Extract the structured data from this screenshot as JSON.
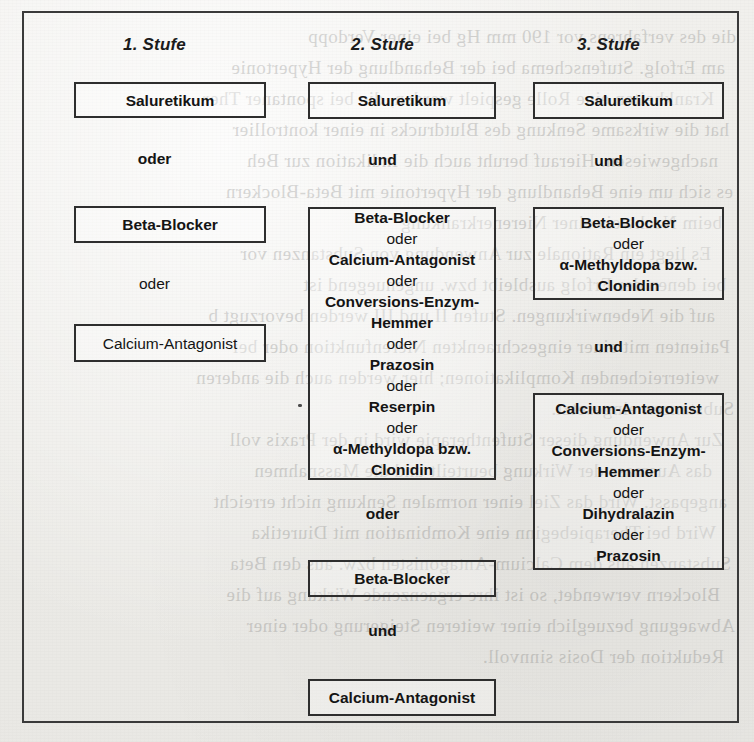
{
  "figure": {
    "columns": [
      {
        "header": "1. Stufe",
        "nodes": [
          {
            "kind": "box",
            "bold": true,
            "lines": [
              {
                "text": "Saluretikum",
                "type": "drug"
              }
            ]
          },
          {
            "kind": "connector",
            "text": "oder",
            "bold": true
          },
          {
            "kind": "box",
            "bold": true,
            "lines": [
              {
                "text": "Beta-Blocker",
                "type": "drug"
              }
            ]
          },
          {
            "kind": "connector",
            "text": "oder",
            "bold": false
          },
          {
            "kind": "box",
            "bold": false,
            "lines": [
              {
                "text": "Calcium-Antagonist",
                "type": "drug"
              }
            ]
          }
        ]
      },
      {
        "header": "2. Stufe",
        "nodes": [
          {
            "kind": "box",
            "bold": true,
            "lines": [
              {
                "text": "Saluretikum",
                "type": "drug"
              }
            ]
          },
          {
            "kind": "connector",
            "text": "und",
            "bold": true
          },
          {
            "kind": "box",
            "bold": true,
            "lines": [
              {
                "text": "Beta-Blocker",
                "type": "drug"
              },
              {
                "text": "oder",
                "type": "conj"
              },
              {
                "text": "Calcium-Antagonist",
                "type": "drug"
              },
              {
                "text": "oder",
                "type": "conj"
              },
              {
                "text": "Conversions-Enzym-",
                "type": "drug"
              },
              {
                "text": "Hemmer",
                "type": "drug"
              },
              {
                "text": "oder",
                "type": "conj"
              },
              {
                "text": "Prazosin",
                "type": "drug"
              },
              {
                "text": "oder",
                "type": "conj"
              },
              {
                "text": "Reserpin",
                "type": "drug"
              },
              {
                "text": "oder",
                "type": "conj"
              },
              {
                "text": "α-Methyldopa bzw.",
                "type": "drug"
              },
              {
                "text": "Clonidin",
                "type": "drug"
              }
            ]
          },
          {
            "kind": "connector",
            "text": "oder",
            "bold": true
          },
          {
            "kind": "box",
            "bold": true,
            "lines": [
              {
                "text": "Beta-Blocker",
                "type": "drug"
              }
            ]
          },
          {
            "kind": "connector",
            "text": "und",
            "bold": true
          },
          {
            "kind": "box",
            "bold": true,
            "lines": [
              {
                "text": "Calcium-Antagonist",
                "type": "drug"
              }
            ]
          }
        ]
      },
      {
        "header": "3. Stufe",
        "nodes": [
          {
            "kind": "box",
            "bold": true,
            "lines": [
              {
                "text": "Saluretikum",
                "type": "drug"
              }
            ]
          },
          {
            "kind": "connector",
            "text": "und",
            "bold": true
          },
          {
            "kind": "box",
            "bold": true,
            "lines": [
              {
                "text": "Beta-Blocker",
                "type": "drug"
              },
              {
                "text": "oder",
                "type": "conj"
              },
              {
                "text": "α-Methyldopa bzw.",
                "type": "drug"
              },
              {
                "text": "Clonidin",
                "type": "drug"
              }
            ]
          },
          {
            "kind": "connector",
            "text": "und",
            "bold": true
          },
          {
            "kind": "box",
            "bold": true,
            "lines": [
              {
                "text": "Calcium-Antagonist",
                "type": "drug"
              },
              {
                "text": "oder",
                "type": "conj"
              },
              {
                "text": "Conversions-Enzym-",
                "type": "drug"
              },
              {
                "text": "Hemmer",
                "type": "drug"
              },
              {
                "text": "oder",
                "type": "conj"
              },
              {
                "text": "Dihydralazin",
                "type": "drug"
              },
              {
                "text": "oder",
                "type": "conj"
              },
              {
                "text": "Prazosin",
                "type": "drug"
              }
            ]
          }
        ]
      }
    ]
  },
  "colors": {
    "paper": "#eeeeec",
    "ink": "#141414",
    "frame_border": "#3a3a3a",
    "box_border": "#2e2e2e"
  },
  "bleed_through": {
    "lines": [
      "die des verfahrens vor 190 mm Hg bei einer Verdopp",
      "am Erfolg. Stufenschema bei der Behandlung der Hypertonie",
      "Krankheiten eine Rolle gespielt werden, die bei spontaner Ther",
      "hat die wirksame Senkung des Blutdrucks in einer kontrollier",
      "nachgewiesen. Hierauf beruht auch die Indikation zur Beh",
      "es sich um eine Behandlung der Hypertonie mit Beta-Blockern",
      "beim Nachweis einer Nierenerkrankung",
      "Es liegt ein Rationale zur Anwendung von Substanzen vor",
      "bei denen der Erfolg ausbleibt bzw. ungenuegend ist",
      "auf die Nebenwirkungen. Stufen II und III werden bevorzugt b",
      "Patienten mit einer eingeschraenkten Nierenfunktion oder bei",
      "weiterreichenden Komplikationen; hier werden auch die anderen",
      "Substanzen eingesetzt.",
      "Zur Anwendung dieser Stufentherapie wird in der Praxis voll",
      "das Ausmass der Wirkung beurteilt und die Massnahmen",
      "angepasst. Wird das Ziel einer normalen Senkung nicht erreicht",
      "Wird bei Therapiebeginn eine Kombination mit Diuretika",
      "Substanzen aus dem Calcium-Antagonisten bzw. aus den Beta",
      "Blockern verwendet, so ist ihre ergaenzende Wirkung auf die",
      "Abwaegung bezueglich einer weiteren Steigerung oder einer",
      "Reduktion der Dosis sinnvoll."
    ]
  }
}
